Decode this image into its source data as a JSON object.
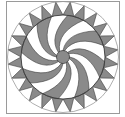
{
  "figure": {
    "frame": {
      "x": 6.5,
      "y": 1.5,
      "width": 113,
      "height": 112,
      "stroke": "#9a9a9a"
    },
    "center": {
      "x": 63,
      "y": 57
    },
    "outer_radius": 55.5,
    "inner_radius": 42,
    "hub_radius": 6.5,
    "spike_count": 24,
    "blade_count": 8,
    "colors": {
      "gray": "#8a8a8a",
      "white": "#ffffff",
      "line": "#3c3c3c",
      "outer_line": "#9a9a9a"
    }
  }
}
